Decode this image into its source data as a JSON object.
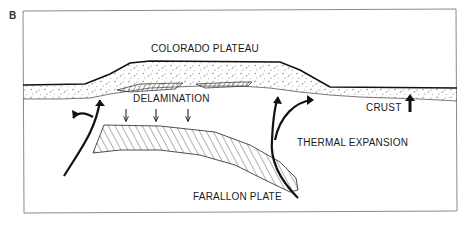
{
  "figure": {
    "panel_label": "B",
    "labels": {
      "plateau": "COLORADO PLATEAU",
      "delamination": "DELAMINATION",
      "crust": "CRUST",
      "thermal_expansion": "THERMAL EXPANSION",
      "farallon_plate": "FARALLON PLATE"
    },
    "colors": {
      "ink": "#1a1a1a",
      "frame": "#888888",
      "background": "#ffffff"
    }
  }
}
